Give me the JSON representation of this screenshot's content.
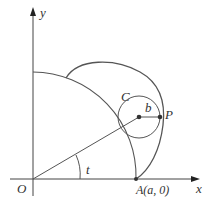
{
  "diagram": {
    "axes": {
      "x_label": "x",
      "y_label": "y",
      "origin_label": "O"
    },
    "labels": {
      "circle": "C",
      "radius": "b",
      "point": "P",
      "angle": "t",
      "a_point": "A(a, 0)"
    },
    "colors": {
      "stroke": "#444444",
      "background": "#ffffff"
    }
  }
}
